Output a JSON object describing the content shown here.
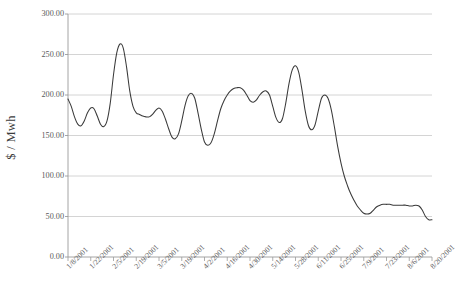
{
  "chart_data": {
    "type": "line",
    "title": "",
    "xlabel": "",
    "ylabel": "$ / Mwh",
    "ylim": [
      0,
      300
    ],
    "ytick_labels": [
      "300.00",
      "250.00",
      "200.00",
      "150.00",
      "100.00",
      "50.00",
      "0.00"
    ],
    "ytick_values": [
      300,
      250,
      200,
      150,
      100,
      50,
      0
    ],
    "grid": true,
    "legend": "none",
    "xtick_labels": [
      "1/8/2001",
      "1/22/2001",
      "2/5/2001",
      "2/19/2001",
      "3/5/2001",
      "3/19/2001",
      "4/2/2001",
      "4/16/2001",
      "4/30/2001",
      "5/14/2001",
      "5/28/2001",
      "6/11/2001",
      "6/25/2001",
      "7/9/2001",
      "7/23/2001",
      "8/6/2001",
      "8/20/2001"
    ],
    "series": [
      {
        "name": "Price",
        "color": "#3a3a3a",
        "x": [
          0,
          1,
          2,
          3,
          4,
          5,
          6,
          7,
          8,
          9,
          10,
          11,
          12,
          13,
          14,
          15,
          16,
          17,
          18,
          19,
          20,
          21,
          22,
          23,
          24,
          25,
          26,
          27,
          28,
          29,
          30,
          31,
          32,
          33,
          34,
          35,
          36,
          37,
          38,
          39,
          40,
          41,
          42,
          43,
          44,
          45,
          46,
          47,
          48,
          49,
          50,
          51,
          52,
          53,
          54,
          55,
          56,
          57,
          58,
          59,
          60,
          61,
          62,
          63,
          64,
          65,
          66,
          67,
          68,
          69,
          70,
          71,
          72,
          73,
          74,
          75,
          76,
          77,
          78,
          79,
          80
        ],
        "values": [
          195,
          186,
          173,
          164,
          162,
          168,
          178,
          184,
          183,
          174,
          164,
          161,
          168,
          190,
          225,
          252,
          263,
          258,
          235,
          205,
          186,
          178,
          176,
          174,
          173,
          173,
          176,
          181,
          184,
          180,
          170,
          158,
          148,
          146,
          152,
          168,
          187,
          199,
          202,
          196,
          178,
          158,
          142,
          138,
          141,
          152,
          168,
          183,
          193,
          200,
          205,
          208,
          209,
          209,
          206,
          200,
          193,
          191,
          194,
          200,
          204,
          205,
          200,
          186,
          172,
          166,
          171,
          190,
          214,
          231,
          236,
          228,
          206,
          180,
          162,
          157,
          163,
          180,
          196,
          200,
          196
        ]
      }
    ],
    "series_tail": {
      "name": "Price continued",
      "x": [
        81,
        82,
        83,
        84,
        85,
        86,
        87,
        88,
        89,
        90,
        91,
        92,
        93,
        94,
        95,
        96,
        97,
        98,
        99,
        100,
        101,
        102,
        103,
        104,
        105,
        106,
        107,
        108,
        109,
        110,
        111,
        112
      ],
      "values": [
        182,
        160,
        136,
        116,
        100,
        88,
        78,
        70,
        63,
        58,
        54,
        53,
        54,
        58,
        62,
        64,
        65,
        65,
        65,
        64,
        64,
        64,
        64,
        64,
        63,
        63,
        64,
        63,
        58,
        50,
        46,
        46
      ]
    },
    "annotations": []
  },
  "axes": {
    "y_title": "$ / Mwh"
  }
}
